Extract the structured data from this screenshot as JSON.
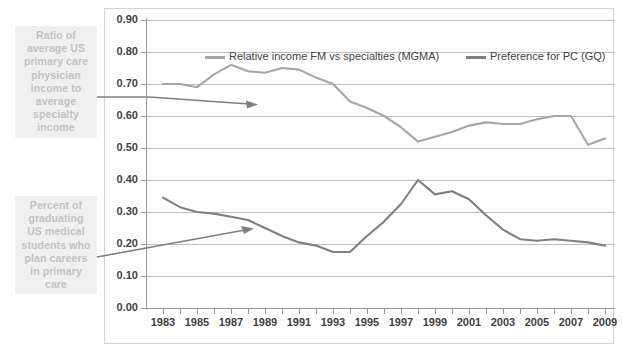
{
  "annotations": {
    "top_label": "Ratio of average US primary care physician income to average specialty income",
    "bottom_label": "Percent of graduating US medical students who plan careers in primary care"
  },
  "legend": {
    "position": "top-inside",
    "items": [
      {
        "label": "Relative income FM vs specialties (MGMA)",
        "color": "#a6a6a6"
      },
      {
        "label": "Preference for PC (GQ)",
        "color": "#808080"
      }
    ]
  },
  "colors": {
    "series_income": "#a6a6a6",
    "series_preference": "#808080",
    "gridline": "#bfbfbf",
    "axis": "#9a9a9a",
    "callout_bg": "#f0f0f0",
    "callout_text": "#c2c2c2",
    "tick_text": "#3f3f3f",
    "frame_border": "#d4d4d4"
  },
  "chart_data": {
    "type": "line",
    "title": "",
    "xlabel": "",
    "ylabel": "",
    "ylim": [
      0.0,
      0.9
    ],
    "ytick_labels": [
      "0.90",
      "0.80",
      "0.70",
      "0.60",
      "0.50",
      "0.40",
      "0.30",
      "0.20",
      "0.10",
      "0.00"
    ],
    "ytick_values": [
      0.9,
      0.8,
      0.7,
      0.6,
      0.5,
      0.4,
      0.3,
      0.2,
      0.1,
      0.0
    ],
    "grid": true,
    "xlim": [
      1983,
      2009
    ],
    "x": [
      1983,
      1984,
      1985,
      1986,
      1987,
      1988,
      1989,
      1990,
      1991,
      1992,
      1993,
      1994,
      1995,
      1996,
      1997,
      1998,
      1999,
      2000,
      2001,
      2002,
      2003,
      2004,
      2005,
      2006,
      2007,
      2008,
      2009
    ],
    "xtick_labels": [
      "1983",
      "1985",
      "1987",
      "1989",
      "1991",
      "1993",
      "1995",
      "1997",
      "1999",
      "2001",
      "2003",
      "2005",
      "2007",
      "2009"
    ],
    "xtick_label_years": [
      1983,
      1985,
      1987,
      1989,
      1991,
      1993,
      1995,
      1997,
      1999,
      2001,
      2003,
      2005,
      2007,
      2009
    ],
    "series": [
      {
        "name": "Relative income FM vs specialties (MGMA)",
        "color": "#a6a6a6",
        "values": [
          0.7,
          0.7,
          0.69,
          0.73,
          0.76,
          0.74,
          0.735,
          0.75,
          0.745,
          0.72,
          0.7,
          0.645,
          0.625,
          0.6,
          0.565,
          0.52,
          0.535,
          0.55,
          0.57,
          0.58,
          0.575,
          0.575,
          0.59,
          0.6,
          0.6,
          0.51,
          0.53
        ]
      },
      {
        "name": "Preference for PC (GQ)",
        "color": "#808080",
        "values": [
          0.345,
          0.315,
          0.3,
          0.295,
          0.285,
          0.275,
          0.25,
          0.225,
          0.205,
          0.195,
          0.175,
          0.175,
          0.225,
          0.27,
          0.325,
          0.4,
          0.355,
          0.365,
          0.34,
          0.29,
          0.245,
          0.215,
          0.21,
          0.215,
          0.21,
          0.205,
          0.195
        ]
      }
    ]
  }
}
